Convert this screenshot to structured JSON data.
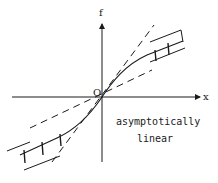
{
  "figure": {
    "type": "function-sketch",
    "axes": {
      "x_label": "x",
      "y_label": "f",
      "origin_label": "O"
    },
    "annotation": {
      "line1": "asymptotically",
      "line2": "linear"
    },
    "elements": {
      "curve": "odd function through origin, bending toward asymptotic lines",
      "dashed_lines": 2,
      "band": "hatched band bounding the curve at large |x|"
    },
    "colors": {
      "ink": "#1a1a1a",
      "background": "#ffffff"
    }
  }
}
